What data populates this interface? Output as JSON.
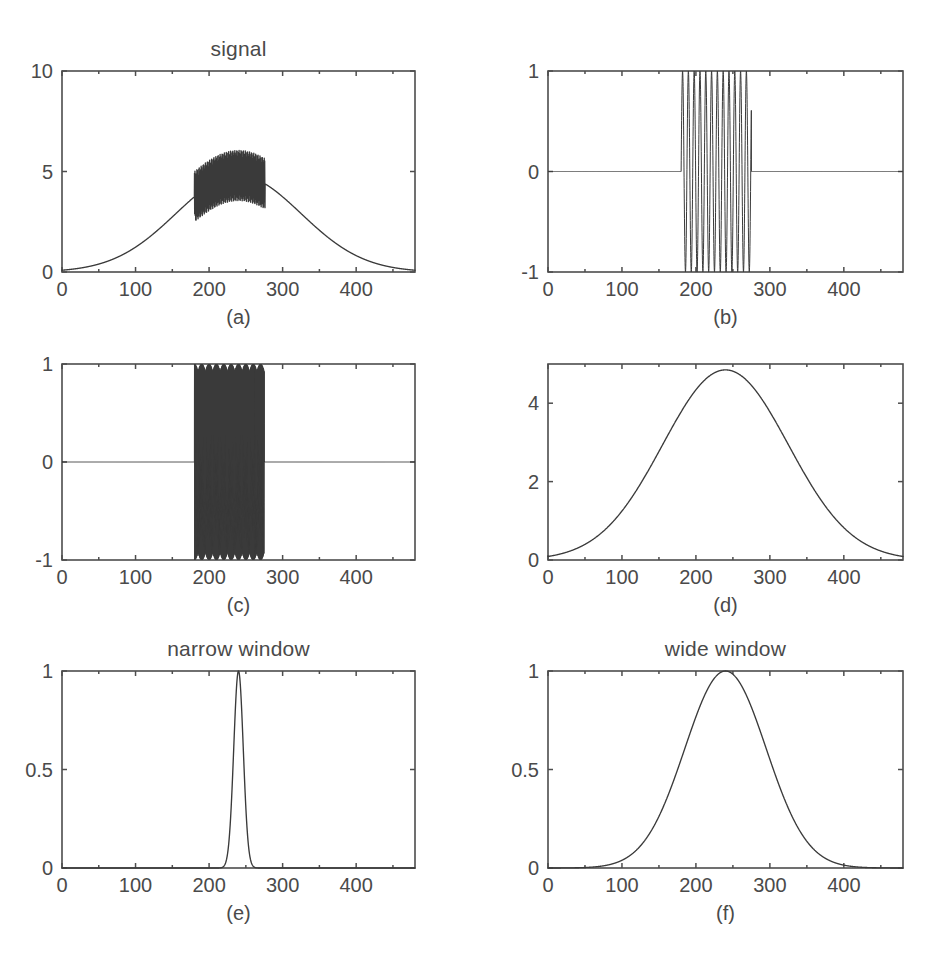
{
  "figure": {
    "background_color": "#ffffff",
    "line_color": "#3a3a3a",
    "axis_color": "#4d4d4d",
    "text_color": "#4a4a4a",
    "width": 945,
    "height": 970,
    "rows": 3,
    "cols": 2
  },
  "panels": {
    "a": {
      "caption": "(a)",
      "title": "signal",
      "x_ticks": [
        "0",
        "100",
        "200",
        "300",
        "400"
      ],
      "y_ticks": [
        "0",
        "5",
        "10"
      ]
    },
    "b": {
      "caption": "(b)",
      "title": "",
      "x_ticks": [
        "0",
        "100",
        "200",
        "300",
        "400"
      ],
      "y_ticks": [
        "-1",
        "0",
        "1"
      ]
    },
    "c": {
      "caption": "(c)",
      "title": "",
      "x_ticks": [
        "0",
        "100",
        "200",
        "300",
        "400"
      ],
      "y_ticks": [
        "-1",
        "0",
        "1"
      ]
    },
    "d": {
      "caption": "(d)",
      "title": "",
      "x_ticks": [
        "0",
        "100",
        "200",
        "300",
        "400"
      ],
      "y_ticks": [
        "0",
        "2",
        "4"
      ]
    },
    "e": {
      "caption": "(e)",
      "title": "narrow window",
      "x_ticks": [
        "0",
        "100",
        "200",
        "300",
        "400"
      ],
      "y_ticks": [
        "0",
        "0.5",
        "1"
      ]
    },
    "f": {
      "caption": "(f)",
      "title": "wide window",
      "x_ticks": [
        "0",
        "100",
        "200",
        "300",
        "400"
      ],
      "y_ticks": [
        "0",
        "0.5",
        "1"
      ]
    }
  },
  "chart_data": [
    {
      "id": "a",
      "type": "line",
      "title": "signal",
      "caption": "(a)",
      "xlabel": "",
      "ylabel": "",
      "xlim": [
        0,
        480
      ],
      "ylim": [
        0,
        10
      ],
      "xticks": [
        0,
        100,
        200,
        300,
        400
      ],
      "yticks": [
        0,
        5,
        10
      ],
      "grid": false,
      "legend": "none",
      "description": "Wide Gaussian envelope (amplitude 4.8, center 240, sigma 85) with a high-frequency oscillatory burst of amplitude ~1.2 superimposed between x=180 and x=275; the burst peaks reach about 6.6.",
      "series": [
        {
          "name": "signal",
          "model": "gauss_plus_burst",
          "gauss_amp": 4.8,
          "gauss_center": 240,
          "gauss_sigma": 85,
          "burst_amp": 1.25,
          "burst_freq": 1.55,
          "burst_start": 180,
          "burst_end": 276,
          "n": 2400
        }
      ]
    },
    {
      "id": "b",
      "type": "line",
      "caption": "(b)",
      "title": "",
      "xlim": [
        0,
        480
      ],
      "ylim": [
        -1,
        1
      ],
      "xticks": [
        0,
        100,
        200,
        300,
        400
      ],
      "yticks": [
        -1,
        0,
        1
      ],
      "grid": false,
      "legend": "none",
      "description": "Zero outside the window; inside x=180..275 a sinusoid of amplitude 1 with about 11 full cycles (period ~8.7 samples).",
      "series": [
        {
          "name": "low-frequency burst",
          "model": "tone_burst",
          "amp": 1.0,
          "freq": 0.1275,
          "burst_start": 180,
          "burst_end": 275,
          "n": 3600
        }
      ]
    },
    {
      "id": "c",
      "type": "line",
      "caption": "(c)",
      "title": "",
      "xlim": [
        0,
        480
      ],
      "ylim": [
        -1,
        1
      ],
      "xticks": [
        0,
        100,
        200,
        300,
        400
      ],
      "yticks": [
        -1,
        0,
        1
      ],
      "grid": false,
      "legend": "none",
      "description": "Zero outside the window; inside x=180..275 a very high-frequency sinusoid of amplitude 1 which renders as a dense solid block with aliasing fringes.",
      "series": [
        {
          "name": "high-frequency burst",
          "model": "tone_burst",
          "amp": 1.0,
          "freq": 1.55,
          "burst_start": 180,
          "burst_end": 275,
          "n": 6000
        }
      ]
    },
    {
      "id": "d",
      "type": "line",
      "caption": "(d)",
      "title": "",
      "xlim": [
        0,
        480
      ],
      "ylim": [
        0,
        5
      ],
      "xticks": [
        0,
        100,
        200,
        300,
        400
      ],
      "yticks": [
        0,
        2,
        4
      ],
      "grid": false,
      "legend": "none",
      "description": "Smooth Gaussian envelope peaking at about 4.85 near x=240 with sigma about 85, reaching nearly zero at both edges.",
      "series": [
        {
          "name": "envelope",
          "model": "gaussian",
          "amp": 4.85,
          "center": 240,
          "sigma": 85,
          "n": 1200
        }
      ]
    },
    {
      "id": "e",
      "type": "line",
      "title": "narrow window",
      "caption": "(e)",
      "xlim": [
        0,
        480
      ],
      "ylim": [
        0,
        1
      ],
      "xticks": [
        0,
        100,
        200,
        300,
        400
      ],
      "yticks": [
        0,
        0.5,
        1
      ],
      "grid": false,
      "legend": "none",
      "description": "Very narrow Gaussian window peaking at 1.0 at x=240 with sigma about 6.5; essentially zero outside x=215..265.",
      "series": [
        {
          "name": "narrow window",
          "model": "gaussian",
          "amp": 1.0,
          "center": 240,
          "sigma": 6.5,
          "n": 2400
        }
      ]
    },
    {
      "id": "f",
      "type": "line",
      "title": "wide window",
      "caption": "(f)",
      "xlim": [
        0,
        480
      ],
      "ylim": [
        0,
        1
      ],
      "xticks": [
        0,
        100,
        200,
        300,
        400
      ],
      "yticks": [
        0,
        0.5,
        1
      ],
      "grid": false,
      "legend": "none",
      "description": "Broad Gaussian window peaking at 1.0 at x=240 with sigma about 55; reaches near zero around x=95 and x=390.",
      "series": [
        {
          "name": "wide window",
          "model": "gaussian",
          "amp": 1.0,
          "center": 240,
          "sigma": 55,
          "n": 1600
        }
      ]
    }
  ],
  "layout": {
    "panel_boxes": {
      "a": {
        "left": 62,
        "top": 71,
        "width": 353,
        "height": 201
      },
      "b": {
        "left": 548,
        "top": 71,
        "width": 355,
        "height": 201
      },
      "c": {
        "left": 62,
        "top": 364,
        "width": 353,
        "height": 196
      },
      "d": {
        "left": 548,
        "top": 364,
        "width": 355,
        "height": 196
      },
      "e": {
        "left": 62,
        "top": 671,
        "width": 353,
        "height": 197
      },
      "f": {
        "left": 548,
        "top": 671,
        "width": 355,
        "height": 197
      }
    }
  }
}
